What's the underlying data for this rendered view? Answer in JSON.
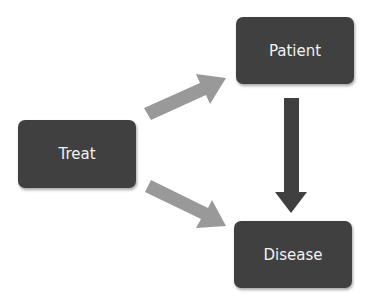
{
  "nodes": {
    "treat": {
      "label": "Treat"
    },
    "patient": {
      "label": "Patient"
    },
    "disease": {
      "label": "Disease"
    }
  },
  "edges": [
    {
      "from": "Treat",
      "to": "Patient",
      "color": "#999999"
    },
    {
      "from": "Treat",
      "to": "Disease",
      "color": "#999999"
    },
    {
      "from": "Patient",
      "to": "Disease",
      "color": "#404040"
    }
  ],
  "colors": {
    "node_fill": "#404040",
    "node_text": "#f2f2f2",
    "light_arrow": "#999999",
    "dark_arrow": "#404040"
  }
}
